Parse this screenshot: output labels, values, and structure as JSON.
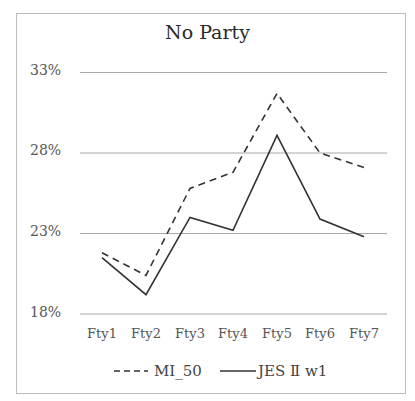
{
  "chart_data": {
    "type": "line",
    "title": "No Party",
    "xlabel": "",
    "ylabel": "",
    "categories": [
      "Fty1",
      "Fty2",
      "Fty3",
      "Fty4",
      "Fty5",
      "Fty6",
      "Fty7"
    ],
    "series": [
      {
        "name": "MI_50",
        "style": "dashed",
        "values": [
          21.8,
          20.4,
          25.8,
          26.8,
          31.7,
          28.0,
          27.1
        ]
      },
      {
        "name": "JES Ⅱ w1",
        "style": "solid",
        "values": [
          21.5,
          19.2,
          24.0,
          23.2,
          29.1,
          23.9,
          22.8
        ]
      }
    ],
    "yticks": [
      "33%",
      "28%",
      "23%",
      "18%"
    ],
    "ylim": [
      18,
      33
    ],
    "grid": true,
    "legend_position": "bottom"
  },
  "colors": {
    "line": "#333333",
    "grid": "#a8a8a8",
    "frame": "#bdbdbd"
  }
}
